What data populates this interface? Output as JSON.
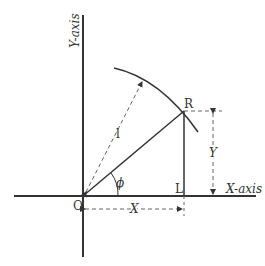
{
  "diagram": {
    "axes": {
      "x_label": "X-axis",
      "y_label": "Y-axis"
    },
    "points": {
      "origin": "O",
      "R": "R",
      "L": "L"
    },
    "dimensions": {
      "radius": "l",
      "angle": "ϕ",
      "x_dim": "X",
      "y_dim": "Y"
    },
    "colors": {
      "line": "#333333",
      "dashed": "#666666"
    }
  }
}
